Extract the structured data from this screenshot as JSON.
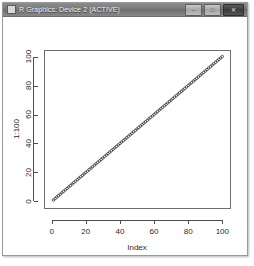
{
  "window": {
    "title": "R Graphics: Device 2 (ACTIVE)",
    "icon": "app-square-icon",
    "buttons": [
      {
        "name": "minimize-button",
        "glyph": "–"
      },
      {
        "name": "maximize-button",
        "glyph": "□"
      },
      {
        "name": "close-button",
        "glyph": "✕"
      }
    ]
  },
  "chart_data": {
    "type": "scatter",
    "title": "",
    "xlabel": "Index",
    "ylabel": "1:100",
    "xlim": [
      0,
      100
    ],
    "ylim": [
      0,
      100
    ],
    "xticks": [
      0,
      20,
      40,
      60,
      80,
      100
    ],
    "yticks": [
      0,
      20,
      40,
      60,
      80,
      100
    ],
    "xticklabels": [
      "0",
      "20",
      "40",
      "60",
      "80",
      "100"
    ],
    "yticklabels": [
      "0",
      "20",
      "40",
      "60",
      "80",
      "100"
    ],
    "grid": false,
    "legend": false,
    "marker": "open-circle",
    "marker_color": "#333333",
    "background": "#ffffff",
    "series": [
      {
        "name": "1:100",
        "x": [
          1,
          2,
          3,
          4,
          5,
          6,
          7,
          8,
          9,
          10,
          11,
          12,
          13,
          14,
          15,
          16,
          17,
          18,
          19,
          20,
          21,
          22,
          23,
          24,
          25,
          26,
          27,
          28,
          29,
          30,
          31,
          32,
          33,
          34,
          35,
          36,
          37,
          38,
          39,
          40,
          41,
          42,
          43,
          44,
          45,
          46,
          47,
          48,
          49,
          50,
          51,
          52,
          53,
          54,
          55,
          56,
          57,
          58,
          59,
          60,
          61,
          62,
          63,
          64,
          65,
          66,
          67,
          68,
          69,
          70,
          71,
          72,
          73,
          74,
          75,
          76,
          77,
          78,
          79,
          80,
          81,
          82,
          83,
          84,
          85,
          86,
          87,
          88,
          89,
          90,
          91,
          92,
          93,
          94,
          95,
          96,
          97,
          98,
          99,
          100
        ],
        "y": [
          1,
          2,
          3,
          4,
          5,
          6,
          7,
          8,
          9,
          10,
          11,
          12,
          13,
          14,
          15,
          16,
          17,
          18,
          19,
          20,
          21,
          22,
          23,
          24,
          25,
          26,
          27,
          28,
          29,
          30,
          31,
          32,
          33,
          34,
          35,
          36,
          37,
          38,
          39,
          40,
          41,
          42,
          43,
          44,
          45,
          46,
          47,
          48,
          49,
          50,
          51,
          52,
          53,
          54,
          55,
          56,
          57,
          58,
          59,
          60,
          61,
          62,
          63,
          64,
          65,
          66,
          67,
          68,
          69,
          70,
          71,
          72,
          73,
          74,
          75,
          76,
          77,
          78,
          79,
          80,
          81,
          82,
          83,
          84,
          85,
          86,
          87,
          88,
          89,
          90,
          91,
          92,
          93,
          94,
          95,
          96,
          97,
          98,
          99,
          100
        ]
      }
    ]
  }
}
